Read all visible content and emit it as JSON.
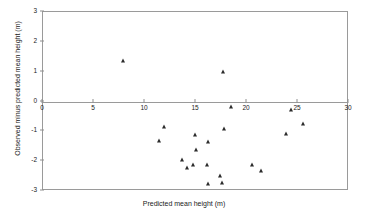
{
  "chart_data": {
    "type": "scatter",
    "title": "",
    "xlabel": "Predicted mean height (m)",
    "ylabel": "Observed minus predicted mean height (m)",
    "xlim": [
      0,
      30
    ],
    "ylim": [
      -3,
      3
    ],
    "xticks": [
      0,
      5,
      10,
      15,
      20,
      25,
      30
    ],
    "xtick_labels": [
      "0",
      "5",
      "10",
      "15",
      "20",
      "25",
      "30"
    ],
    "yticks": [
      -3,
      -2,
      -1,
      0,
      1,
      2,
      3
    ],
    "ytick_labels": [
      "-3",
      "-2",
      "-1",
      "0",
      "1",
      "2",
      "3"
    ],
    "grid": false,
    "legend": null,
    "marker": "triangle",
    "marker_color": "#2b2b2b",
    "zero_reference_line": 0,
    "series": [
      {
        "name": "Residuals",
        "points": [
          {
            "x": 7.8,
            "y": 1.37
          },
          {
            "x": 17.6,
            "y": 1.0
          },
          {
            "x": 18.4,
            "y": -0.2
          },
          {
            "x": 24.3,
            "y": -0.27
          },
          {
            "x": 25.5,
            "y": -0.77
          },
          {
            "x": 11.9,
            "y": -0.85
          },
          {
            "x": 17.7,
            "y": -0.93
          },
          {
            "x": 23.8,
            "y": -1.09
          },
          {
            "x": 14.9,
            "y": -1.13
          },
          {
            "x": 11.4,
            "y": -1.31
          },
          {
            "x": 16.2,
            "y": -1.37
          },
          {
            "x": 15.0,
            "y": -1.63
          },
          {
            "x": 13.6,
            "y": -1.95
          },
          {
            "x": 16.1,
            "y": -2.12
          },
          {
            "x": 14.7,
            "y": -2.13
          },
          {
            "x": 20.5,
            "y": -2.12
          },
          {
            "x": 14.1,
            "y": -2.22
          },
          {
            "x": 21.4,
            "y": -2.33
          },
          {
            "x": 17.4,
            "y": -2.5
          },
          {
            "x": 16.2,
            "y": -2.76
          },
          {
            "x": 17.5,
            "y": -2.73
          }
        ]
      }
    ]
  }
}
